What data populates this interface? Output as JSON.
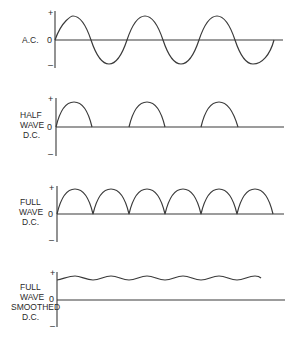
{
  "colors": {
    "ink": "#3a3a3a",
    "background": "#ffffff"
  },
  "axis_ticks": {
    "plus": "+",
    "zero": "0",
    "minus": "–"
  },
  "panels": [
    {
      "id": "ac",
      "label_lines": [
        "A.C."
      ],
      "waveform": "sine"
    },
    {
      "id": "half-wave",
      "label_lines": [
        "HALF",
        "WAVE",
        "D.C."
      ],
      "waveform": "half-wave-rectified"
    },
    {
      "id": "full-wave",
      "label_lines": [
        "FULL",
        "WAVE",
        "D.C."
      ],
      "waveform": "full-wave-rectified"
    },
    {
      "id": "smoothed",
      "label_lines": [
        "FULL",
        "WAVE",
        "SMOOTHED",
        "D.C."
      ],
      "waveform": "smoothed-ripple"
    }
  ]
}
